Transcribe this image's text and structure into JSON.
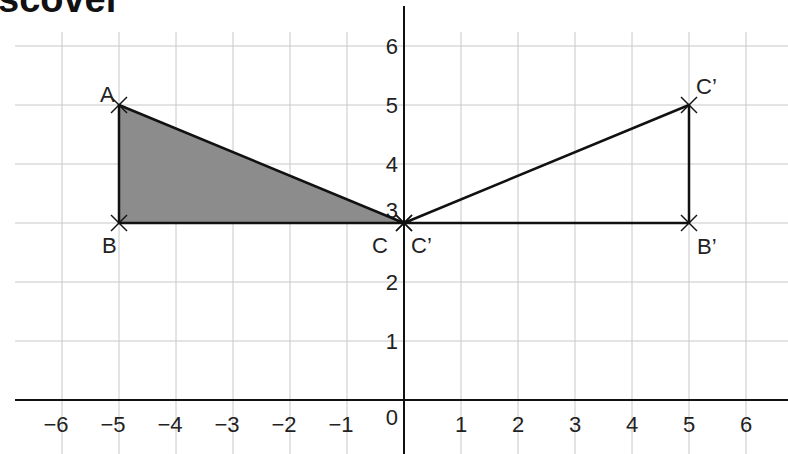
{
  "header": {
    "title_fragment": "scover"
  },
  "diagram": {
    "origin_px": [
      404,
      400
    ],
    "unit_px": [
      57,
      59
    ],
    "x_ticks": [
      "−6",
      "−5",
      "−4",
      "−3",
      "−2",
      "−1",
      "1",
      "2",
      "3",
      "4",
      "5",
      "6"
    ],
    "x_tick_values": [
      -6,
      -5,
      -4,
      -3,
      -2,
      -1,
      1,
      2,
      3,
      4,
      5,
      6
    ],
    "y_ticks": [
      "1",
      "2",
      "3",
      "4",
      "5",
      "6"
    ],
    "y_tick_values": [
      1,
      2,
      3,
      4,
      5,
      6
    ],
    "origin_label": "0",
    "shaded_triangle": {
      "fill": "#8c8c8c",
      "vertices": [
        {
          "label": "A",
          "x": -5,
          "y": 5
        },
        {
          "label": "B",
          "x": -5,
          "y": 3
        },
        {
          "label": "C",
          "x": 0,
          "y": 3
        }
      ]
    },
    "image_triangle": {
      "vertices": [
        {
          "label": "C'",
          "x": 0,
          "y": 3
        },
        {
          "label": "B'",
          "x": 5,
          "y": 3
        },
        {
          "label": "C'",
          "x": 5,
          "y": 5
        }
      ]
    },
    "labels": {
      "A": "A",
      "B": "B",
      "C": "C",
      "C_prime_origin": "C’",
      "B_prime": "B’",
      "C_prime_top": "C’"
    },
    "grid_color": "#c8c8c8",
    "axis_color": "#111111",
    "line_color": "#111111"
  }
}
